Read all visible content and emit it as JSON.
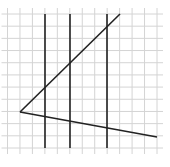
{
  "diagram": {
    "type": "geometry-grid",
    "grid": {
      "x_start": 7.5,
      "y_start": 14,
      "spacing": 12.3,
      "cols": 13,
      "rows": 12,
      "x_end": 157,
      "y_end": 148,
      "color": "#d4d4d4"
    },
    "vertex": {
      "x": 20,
      "y": 112
    },
    "rays": [
      {
        "name": "upper-ray",
        "x1": 20,
        "y1": 112,
        "x2": 120,
        "y2": 14
      },
      {
        "name": "lower-ray",
        "x1": 20,
        "y1": 112,
        "x2": 157,
        "y2": 137
      }
    ],
    "parallel_lines": [
      {
        "name": "parallel-line-1",
        "x": 45,
        "y1": 14,
        "y2": 148
      },
      {
        "name": "parallel-line-2",
        "x": 70,
        "y1": 14,
        "y2": 148
      },
      {
        "name": "parallel-line-3",
        "x": 107,
        "y1": 14,
        "y2": 148
      }
    ],
    "line_color": "#222222"
  }
}
